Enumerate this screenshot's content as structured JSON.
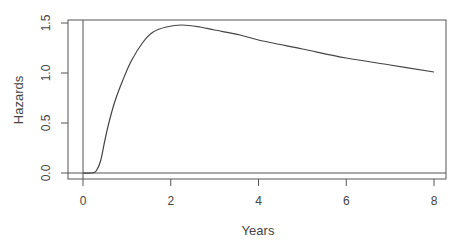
{
  "chart_data": {
    "type": "line",
    "title": "",
    "xlabel": "Years",
    "ylabel": "Hazards",
    "xlim": [
      -0.35,
      8.3
    ],
    "ylim": [
      -0.05,
      1.53
    ],
    "x_ticks": [
      0,
      2,
      4,
      6,
      8
    ],
    "x_tick_labels": [
      "0",
      "2",
      "4",
      "6",
      "8"
    ],
    "y_ticks": [
      0.0,
      0.5,
      1.0,
      1.5
    ],
    "y_tick_labels": [
      "0.0",
      "0.5",
      "1.0",
      "1.5"
    ],
    "grid": false,
    "legend": null,
    "reference_lines": {
      "vertical_at_x": 0,
      "horizontal_at_y": 0
    },
    "series": [
      {
        "name": "Hazards",
        "color": "#444444",
        "x": [
          0,
          0.2,
          0.3,
          0.4,
          0.5,
          0.6,
          0.73,
          0.9,
          1.1,
          1.37,
          1.6,
          1.9,
          2.25,
          2.67,
          3.0,
          3.58,
          4.0,
          5.0,
          6.0,
          7.0,
          8.0
        ],
        "y": [
          0,
          0,
          0.02,
          0.12,
          0.33,
          0.52,
          0.72,
          0.92,
          1.12,
          1.31,
          1.41,
          1.46,
          1.48,
          1.46,
          1.43,
          1.38,
          1.33,
          1.24,
          1.15,
          1.08,
          1.01
        ]
      }
    ]
  },
  "axes": {
    "x_title": "Years",
    "y_title": "Hazards"
  }
}
